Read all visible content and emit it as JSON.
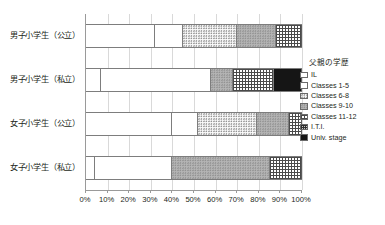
{
  "chart_data": {
    "type": "bar",
    "orientation": "horizontal",
    "stacked": true,
    "normalized": "percent",
    "title": "",
    "xlabel": "",
    "ylabel": "",
    "xlim": [
      0,
      100
    ],
    "grid": true,
    "legend_position": "right",
    "legend_title": "父親の学歴",
    "categories": [
      "男子小学生（公立）",
      "男子小学生（私立）",
      "女子小学生（公立）",
      "女子小学生（私立）"
    ],
    "xtick_labels": [
      "0%",
      "10%",
      "20%",
      "30%",
      "40%",
      "50%",
      "60%",
      "70%",
      "80%",
      "90%",
      "100%"
    ],
    "xtick_values": [
      0,
      10,
      20,
      30,
      40,
      50,
      60,
      70,
      80,
      90,
      100
    ],
    "series": [
      {
        "name": "IL",
        "pattern": "p-il",
        "values": [
          32,
          7,
          40,
          4
        ]
      },
      {
        "name": "Classes 1-5",
        "pattern": "p-c15",
        "values": [
          13,
          51,
          12,
          36
        ]
      },
      {
        "name": "Classes 6-8",
        "pattern": "p-c68",
        "values": [
          25,
          10,
          27,
          0
        ]
      },
      {
        "name": "Classes 9-10",
        "pattern": "p-c910",
        "values": [
          18,
          19,
          15,
          45
        ]
      },
      {
        "name": "Classes 11-12",
        "pattern": "p-c1112",
        "values": [
          12,
          0,
          6,
          15
        ]
      },
      {
        "name": "I.T.I.",
        "pattern": "p-iti",
        "values": [
          0,
          0,
          0,
          0
        ]
      },
      {
        "name": "Univ. stage",
        "pattern": "p-univ",
        "values": [
          0,
          13,
          0,
          0
        ]
      }
    ],
    "bars": [
      {
        "category": "男子小学生（公立）",
        "segments": [
          {
            "name": "IL",
            "pattern": "p-il",
            "value": 32
          },
          {
            "name": "Classes 1-5",
            "pattern": "p-c15",
            "value": 13
          },
          {
            "name": "Classes 6-8",
            "pattern": "p-c68",
            "value": 25
          },
          {
            "name": "Classes 9-10",
            "pattern": "p-c910",
            "value": 18
          },
          {
            "name": "Classes 11-12",
            "pattern": "p-c1112",
            "value": 12
          }
        ]
      },
      {
        "category": "男子小学生（私立）",
        "segments": [
          {
            "name": "IL",
            "pattern": "p-il",
            "value": 7
          },
          {
            "name": "Classes 1-5",
            "pattern": "p-c15",
            "value": 51
          },
          {
            "name": "Classes 6-8",
            "pattern": "p-c910",
            "value": 10
          },
          {
            "name": "Classes 11-12",
            "pattern": "p-c1112",
            "value": 19
          },
          {
            "name": "Univ. stage",
            "pattern": "p-univ",
            "value": 13
          }
        ]
      },
      {
        "category": "女子小学生（公立）",
        "segments": [
          {
            "name": "IL",
            "pattern": "p-il",
            "value": 40
          },
          {
            "name": "Classes 1-5",
            "pattern": "p-c15",
            "value": 12
          },
          {
            "name": "Classes 6-8",
            "pattern": "p-c68",
            "value": 27
          },
          {
            "name": "Classes 9-10",
            "pattern": "p-c910",
            "value": 15
          },
          {
            "name": "Classes 11-12",
            "pattern": "p-c1112",
            "value": 6
          }
        ]
      },
      {
        "category": "女子小学生（私立）",
        "segments": [
          {
            "name": "IL",
            "pattern": "p-il",
            "value": 4
          },
          {
            "name": "Classes 1-5",
            "pattern": "p-c15",
            "value": 36
          },
          {
            "name": "Classes 9-10",
            "pattern": "p-c910",
            "value": 45
          },
          {
            "name": "Classes 11-12",
            "pattern": "p-c1112",
            "value": 15
          }
        ]
      }
    ]
  },
  "legend": {
    "title": "父親の学歴",
    "items": [
      {
        "label": "IL",
        "pattern": "p-il"
      },
      {
        "label": "Classes 1-5",
        "pattern": "p-c15"
      },
      {
        "label": "Classes 6-8",
        "pattern": "p-c68"
      },
      {
        "label": "Classes 9-10",
        "pattern": "p-c910"
      },
      {
        "label": "Classes 11-12",
        "pattern": "p-c1112"
      },
      {
        "label": "I.T.I.",
        "pattern": "p-iti"
      },
      {
        "label": "Univ. stage",
        "pattern": "p-univ"
      }
    ]
  }
}
